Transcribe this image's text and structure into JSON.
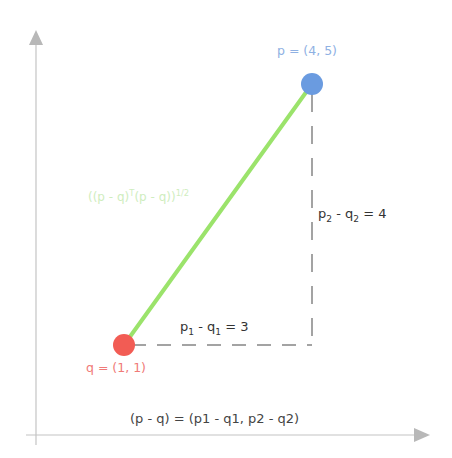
{
  "diagram": {
    "colors": {
      "axis": "#bdbdbd",
      "arrowhead": "#b8b8b8",
      "dashed": "#9e9e9e",
      "distance_line": "#9be36b",
      "point_p": "#6a9be0",
      "point_q": "#f25c54",
      "p_label": "#8fb1e3",
      "q_label": "#f07a78",
      "distance_label": "#a8e08a"
    },
    "points": {
      "p": {
        "name": "p",
        "coords": [
          4,
          5
        ],
        "label": "p = (4, 5)",
        "px": [
          312,
          84
        ]
      },
      "q": {
        "name": "q",
        "coords": [
          1,
          1
        ],
        "label": "q = (1, 1)",
        "px": [
          124,
          345
        ]
      }
    },
    "labels": {
      "distance": {
        "base": "((p - q)",
        "sup1": "T",
        "mid": "(p - q))",
        "sup2": "1/2"
      },
      "dx": {
        "p": "p",
        "p_sub": "1",
        "minus": " - ",
        "q": "q",
        "q_sub": "1",
        "rest": " = 3"
      },
      "dy": {
        "p": "p",
        "p_sub": "2",
        "minus": " - ",
        "q": "q",
        "q_sub": "2",
        "rest": " = 4"
      },
      "vector": "(p - q) = (p1 - q1, p2 - q2)"
    },
    "axes": {
      "origin_px": [
        36,
        435
      ],
      "x_end_px": [
        428,
        435
      ],
      "y_end_px": [
        36,
        32
      ]
    }
  }
}
